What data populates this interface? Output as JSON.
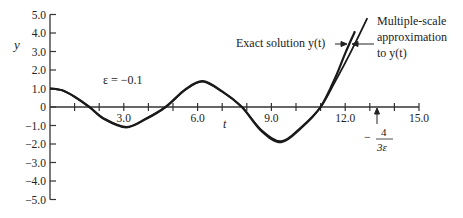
{
  "chart_data": {
    "type": "line",
    "title": "",
    "xlabel": "t",
    "ylabel": "y",
    "xlim": [
      0,
      15.0
    ],
    "ylim": [
      -5.0,
      5.0
    ],
    "grid": false,
    "x_ticks": [
      1,
      2,
      3,
      4,
      5,
      6,
      7,
      8,
      9,
      10,
      11,
      12,
      13,
      14,
      15
    ],
    "x_tick_labels": [
      {
        "value": 3.0,
        "label": "3.0"
      },
      {
        "value": 6.0,
        "label": "6.0"
      },
      {
        "value": 9.0,
        "label": "9.0"
      },
      {
        "value": 12.0,
        "label": "12.0"
      },
      {
        "value": 15.0,
        "label": "15.0"
      }
    ],
    "y_tick_labels": [
      {
        "value": 5.0,
        "label": "5.0"
      },
      {
        "value": 4.0,
        "label": "4.0"
      },
      {
        "value": 3.0,
        "label": "3.0"
      },
      {
        "value": 2.0,
        "label": "2.0"
      },
      {
        "value": 1.0,
        "label": "1.0"
      },
      {
        "value": 0,
        "label": "0"
      },
      {
        "value": -1.0,
        "label": "-1.0"
      },
      {
        "value": -2.0,
        "label": "-2.0"
      },
      {
        "value": -3.0,
        "label": "-3.0"
      },
      {
        "value": -4.0,
        "label": "-4.0"
      },
      {
        "value": -5.0,
        "label": "-5.0"
      }
    ],
    "series": [
      {
        "name": "Exact solution y(t)",
        "x": [
          0,
          0.5,
          1.0,
          1.6,
          2.2,
          3.1,
          3.9,
          4.7,
          5.5,
          6.2,
          7.0,
          7.8,
          8.6,
          9.4,
          10.2,
          11.0,
          11.6,
          12.0,
          12.4
        ],
        "y": [
          1.0,
          0.9,
          0.55,
          0.0,
          -0.65,
          -1.1,
          -0.65,
          0.0,
          0.95,
          1.4,
          0.85,
          0.0,
          -1.3,
          -1.9,
          -1.15,
          0.0,
          1.6,
          2.9,
          4.1
        ]
      },
      {
        "name": "Multiple-scale approximation to y(t)",
        "x": [
          0,
          0.5,
          1.0,
          1.6,
          2.2,
          3.1,
          3.9,
          4.7,
          5.5,
          6.2,
          7.0,
          7.8,
          8.6,
          9.4,
          10.2,
          11.0,
          11.6,
          12.2,
          12.9
        ],
        "y": [
          1.0,
          0.9,
          0.55,
          0.0,
          -0.62,
          -1.08,
          -0.62,
          0.0,
          0.92,
          1.38,
          0.82,
          0.0,
          -1.25,
          -1.85,
          -1.1,
          0.0,
          1.4,
          2.9,
          4.8
        ]
      }
    ],
    "annotations": [
      {
        "text": "ε = −0.1",
        "x": 3.5,
        "y": 1.6
      },
      {
        "text": "Exact solution y(t)",
        "arrow_to_series": "Exact solution y(t)"
      },
      {
        "text": "Multiple-scale approximation to y(t)",
        "arrow_to_series": "Multiple-scale approximation to y(t)"
      },
      {
        "text": "−4/(3ε)",
        "x": 13.33,
        "arrow": "up to x-axis"
      }
    ]
  },
  "labels": {
    "y_axis": "y",
    "x_axis": "t",
    "epsilon": "ε = −0.1",
    "exact_label": "Exact solution y(t)",
    "approx_line1": "Multiple-scale",
    "approx_line2": "approximation",
    "approx_line3": "to y(t)",
    "marker_minus": "−",
    "marker_num": "4",
    "marker_den": "3ε"
  }
}
